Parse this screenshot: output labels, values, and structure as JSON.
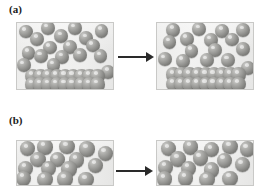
{
  "figure": {
    "background_color": "#ffffff",
    "width": 270,
    "height": 189
  },
  "colors": {
    "sphere_light": "#cfcfcd",
    "sphere_mid": "#979794",
    "sphere_dark": "#646462",
    "box_fill": "#efefee",
    "box_border": "#c9c9c7",
    "arrow": "#2a2a2a",
    "label_text": "#1b1b1b"
  },
  "panels": [
    {
      "id": "a",
      "label": "(a)",
      "arrow": {
        "name": "right-arrow",
        "direction": "right"
      },
      "states": [
        {
          "id": "a-before",
          "name": "box-a-before",
          "free_particles": 17,
          "sediment_rows": 2,
          "sediment_per_row": 9,
          "particles": [
            {
              "x": 0.09,
              "y": 0.13,
              "r": 0.072
            },
            {
              "x": 0.32,
              "y": 0.08,
              "r": 0.072
            },
            {
              "x": 0.6,
              "y": 0.08,
              "r": 0.072
            },
            {
              "x": 0.88,
              "y": 0.12,
              "r": 0.072
            },
            {
              "x": 0.21,
              "y": 0.24,
              "r": 0.072
            },
            {
              "x": 0.46,
              "y": 0.2,
              "r": 0.072
            },
            {
              "x": 0.72,
              "y": 0.23,
              "r": 0.072
            },
            {
              "x": 0.34,
              "y": 0.37,
              "r": 0.072
            },
            {
              "x": 0.55,
              "y": 0.36,
              "r": 0.072
            },
            {
              "x": 0.79,
              "y": 0.34,
              "r": 0.072
            },
            {
              "x": 0.12,
              "y": 0.45,
              "r": 0.072
            },
            {
              "x": 0.25,
              "y": 0.5,
              "r": 0.072
            },
            {
              "x": 0.47,
              "y": 0.52,
              "r": 0.072
            },
            {
              "x": 0.66,
              "y": 0.49,
              "r": 0.072
            },
            {
              "x": 0.87,
              "y": 0.5,
              "r": 0.072
            },
            {
              "x": 0.07,
              "y": 0.64,
              "r": 0.072
            },
            {
              "x": 0.38,
              "y": 0.64,
              "r": 0.072
            },
            {
              "x": 0.95,
              "y": 0.74,
              "r": 0.072
            }
          ],
          "sediment": {
            "row_y": [
              0.8,
              0.93
            ],
            "x_start": 0.16,
            "x_step": 0.085,
            "count": 9,
            "r": 0.075
          }
        },
        {
          "id": "a-after",
          "name": "box-a-after",
          "free_particles": 16,
          "sediment_rows": 2,
          "sediment_per_row": 9,
          "particles": [
            {
              "x": 0.17,
              "y": 0.1,
              "r": 0.072
            },
            {
              "x": 0.44,
              "y": 0.09,
              "r": 0.072
            },
            {
              "x": 0.68,
              "y": 0.12,
              "r": 0.072
            },
            {
              "x": 0.9,
              "y": 0.11,
              "r": 0.072
            },
            {
              "x": 0.31,
              "y": 0.24,
              "r": 0.072
            },
            {
              "x": 0.56,
              "y": 0.26,
              "r": 0.072
            },
            {
              "x": 0.78,
              "y": 0.25,
              "r": 0.072
            },
            {
              "x": 0.13,
              "y": 0.29,
              "r": 0.072
            },
            {
              "x": 0.36,
              "y": 0.42,
              "r": 0.072
            },
            {
              "x": 0.6,
              "y": 0.41,
              "r": 0.072
            },
            {
              "x": 0.9,
              "y": 0.4,
              "r": 0.072
            },
            {
              "x": 0.08,
              "y": 0.55,
              "r": 0.072
            },
            {
              "x": 0.27,
              "y": 0.57,
              "r": 0.072
            },
            {
              "x": 0.52,
              "y": 0.56,
              "r": 0.072
            },
            {
              "x": 0.74,
              "y": 0.56,
              "r": 0.072
            },
            {
              "x": 0.95,
              "y": 0.68,
              "r": 0.072
            }
          ],
          "sediment": {
            "row_y": [
              0.78,
              0.92
            ],
            "x_start": 0.17,
            "x_step": 0.085,
            "count": 9,
            "r": 0.075
          }
        }
      ]
    },
    {
      "id": "b",
      "label": "(b)",
      "arrow": {
        "name": "right-arrow",
        "direction": "right"
      },
      "states": [
        {
          "id": "b-before",
          "name": "box-b-before",
          "free_particles": 16,
          "sediment_rows": 0,
          "sediment_per_row": 0,
          "particles": [
            {
              "x": 0.11,
              "y": 0.17,
              "r": 0.08
            },
            {
              "x": 0.29,
              "y": 0.14,
              "r": 0.08
            },
            {
              "x": 0.52,
              "y": 0.13,
              "r": 0.08
            },
            {
              "x": 0.73,
              "y": 0.18,
              "r": 0.08
            },
            {
              "x": 0.92,
              "y": 0.28,
              "r": 0.08
            },
            {
              "x": 0.22,
              "y": 0.42,
              "r": 0.08
            },
            {
              "x": 0.42,
              "y": 0.42,
              "r": 0.08
            },
            {
              "x": 0.62,
              "y": 0.43,
              "r": 0.08
            },
            {
              "x": 0.82,
              "y": 0.55,
              "r": 0.08
            },
            {
              "x": 0.09,
              "y": 0.62,
              "r": 0.08
            },
            {
              "x": 0.33,
              "y": 0.62,
              "r": 0.08
            },
            {
              "x": 0.54,
              "y": 0.64,
              "r": 0.08
            },
            {
              "x": 0.07,
              "y": 0.85,
              "r": 0.08
            },
            {
              "x": 0.29,
              "y": 0.87,
              "r": 0.08
            },
            {
              "x": 0.5,
              "y": 0.86,
              "r": 0.08
            },
            {
              "x": 0.72,
              "y": 0.88,
              "r": 0.08
            }
          ]
        },
        {
          "id": "b-after",
          "name": "box-b-after",
          "free_particles": 16,
          "sediment_rows": 0,
          "sediment_per_row": 0,
          "particles": [
            {
              "x": 0.12,
              "y": 0.17,
              "r": 0.08
            },
            {
              "x": 0.35,
              "y": 0.14,
              "r": 0.08
            },
            {
              "x": 0.57,
              "y": 0.2,
              "r": 0.08
            },
            {
              "x": 0.76,
              "y": 0.13,
              "r": 0.08
            },
            {
              "x": 0.94,
              "y": 0.18,
              "r": 0.08
            },
            {
              "x": 0.22,
              "y": 0.41,
              "r": 0.08
            },
            {
              "x": 0.45,
              "y": 0.39,
              "r": 0.08
            },
            {
              "x": 0.7,
              "y": 0.44,
              "r": 0.08
            },
            {
              "x": 0.89,
              "y": 0.54,
              "r": 0.08
            },
            {
              "x": 0.09,
              "y": 0.6,
              "r": 0.08
            },
            {
              "x": 0.33,
              "y": 0.62,
              "r": 0.08
            },
            {
              "x": 0.57,
              "y": 0.66,
              "r": 0.08
            },
            {
              "x": 0.08,
              "y": 0.86,
              "r": 0.08
            },
            {
              "x": 0.3,
              "y": 0.84,
              "r": 0.08
            },
            {
              "x": 0.52,
              "y": 0.87,
              "r": 0.08
            },
            {
              "x": 0.76,
              "y": 0.85,
              "r": 0.08
            }
          ]
        }
      ]
    }
  ]
}
